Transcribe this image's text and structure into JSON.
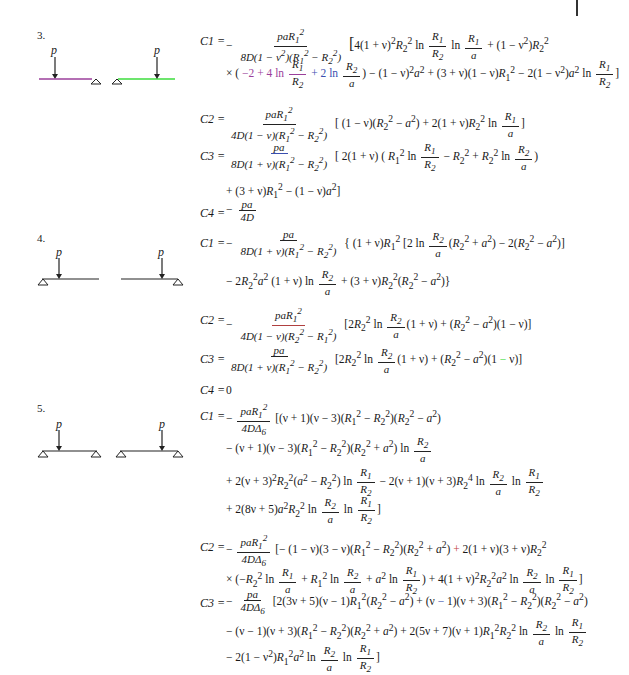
{
  "page": {
    "top_marker": "|"
  },
  "cases": [
    {
      "number": "3.",
      "load_label_left": "p",
      "load_label_right": "p",
      "diagram": "two half-beams: left beam with load p at left end and roller support at right end (magenta highlight); right beam with roller support at left end and load p near right end (green highlight)",
      "equations": [
        {
          "lhs": "C1 =",
          "rhs": [
            "− paR₁² / (8D(1 − ν²)(R₁² − R₂²)) [4(1 + ν)²R₂² ln(R₁/R₂) ln(R₁/a) + (1 − ν²)R₂²",
            "× (−2 + 4 ln(R₁/R₂) + 2 ln(R₂/a)) − (1 − ν)²a² + (3 + ν)(1 − ν)R₁² − 2(1 − ν²)a² ln(R₁/R₂)]"
          ]
        },
        {
          "lhs": "C2 =",
          "rhs": [
            "paR₁² / (4D(1 − ν)(R₁² − R₂²)) [(1 − ν)(R₂² − a²) + 2(1 + ν)R₂² ln(R₁/a)]"
          ]
        },
        {
          "lhs": "C3 =",
          "rhs": [
            "pa / (8D(1 + ν)(R₁² − R₂²)) [2(1 + ν)(R₁² ln(R₁/R₂) − R₂² + R₂² ln(R₂/a))",
            "+ (3 + ν)R₁² − (1 − ν)a²]"
          ]
        },
        {
          "lhs": "C4 =",
          "rhs": [
            "− pa / 4D"
          ]
        }
      ]
    },
    {
      "number": "4.",
      "load_label_left": "p",
      "load_label_right": "p",
      "diagram": "two half-beams: left beam with support at left end, load p near left; right beam with load p near right end and support at right end",
      "equations": [
        {
          "lhs": "C1 =",
          "rhs": [
            "− pa / (8D(1 + ν)(R₁² − R₂²)) {(1 + ν)R₁² [2 ln(R₂/a)(R₂² + a²) − 2(R₂² − a²)]",
            "− 2R₂²a² (1 + ν) ln(R₂/a) + (3 + ν)R₂²(R₂² − a²)}"
          ]
        },
        {
          "lhs": "C2 =",
          "rhs": [
            "− paR₁² / (4D(1 − ν)(R₂² − R₁²)) [2R₂² ln(R₂/a)(1 + ν) + (R₂² − a²)(1 − ν)]"
          ]
        },
        {
          "lhs": "C3 =",
          "rhs": [
            "pa / (8D(1 + ν)(R₁² − R₂²)) [2R₂² ln(R₂/a)(1 + ν) + (R₂² − a²)(1 − ν)]"
          ]
        },
        {
          "lhs": "C4 =",
          "rhs": [
            "0"
          ]
        }
      ]
    },
    {
      "number": "5.",
      "load_label_left": "p",
      "load_label_right": "p",
      "diagram": "two beams each with supports at both ends, load p near inner position",
      "equations": [
        {
          "lhs": "C1 =",
          "rhs": [
            "− paR₁² / (4DΔ₆) [(ν + 1)(ν − 3)(R₁² − R₂²)(R₂² − a²)",
            "− (ν + 1)(ν − 3)(R₁² − R₂²)(R₂² + a²) ln(R₂/a)",
            "+ 2(ν + 3)²R₂²(a² − R₂²) ln(R₁/R₂) − 2(ν + 1)(ν + 3)R₂⁴ ln(R₂/a) ln(R₁/R₂)",
            "+ 2(8ν + 5)a²R₂² ln(R₂/a) ln(R₁/R₂)]"
          ]
        },
        {
          "lhs": "C2 =",
          "rhs": [
            "− paR₁² / (4DΔ₆) [− (1 − ν)(3 − ν)(R₁² − R₂²)(R₂² + a²) + 2(1 + ν)(3 + ν)R₂²",
            "× (−R₂² ln(R₁/a) + R₁² ln(R₂/a) + a² ln(R₁/R₂)) + 4(1 + ν)²R₂²a² ln(R₂/a) ln(R₁/R₂)]"
          ]
        },
        {
          "lhs": "C3 =",
          "rhs": [
            "− pa / (4DΔ₆) [2(3ν + 5)(ν − 1)R₁²(R₂² − a²) + (ν − 1)(ν + 3)(R₁² − R₂²)(R₂² − a²)",
            "− (ν − 1)(ν + 3)(R₁² − R₂²)(R₂² + a²) + 2(5ν + 7)(ν + 1)R₁²R₂² ln(R₂/a) ln(R₁/R₂)",
            "− 2(1 − ν²)R₁²a² ln(R₂/a) ln(R₁/R₂)]"
          ]
        }
      ]
    }
  ],
  "colors": {
    "text": "#1a1a1a",
    "highlight_magenta": "#9b3f9b",
    "highlight_green": "#3ddc3d",
    "highlight_blue": "#3a4fb0"
  }
}
